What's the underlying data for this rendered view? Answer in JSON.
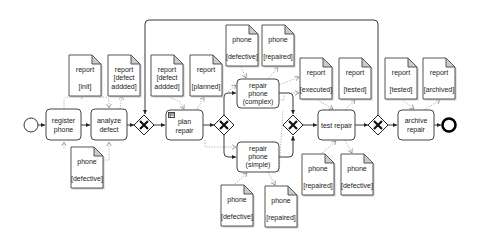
{
  "diagram": {
    "type": "BPMN process",
    "events": {
      "start": {
        "cx": 31,
        "cy": 125
      },
      "end": {
        "cx": 449,
        "cy": 125
      }
    },
    "tasks": [
      {
        "id": "register-phone",
        "lines": [
          "register",
          "phone"
        ],
        "x": 46,
        "y": 109,
        "w": 35,
        "h": 31
      },
      {
        "id": "analyze-defect",
        "lines": [
          "analyze",
          "defect"
        ],
        "x": 91,
        "y": 109,
        "w": 36,
        "h": 31
      },
      {
        "id": "plan-repair",
        "lines": [
          "plan",
          "repair"
        ],
        "x": 166,
        "y": 110,
        "w": 37,
        "h": 30,
        "icon": "business-rule-table-icon"
      },
      {
        "id": "repair-phone-complex",
        "lines": [
          "repair",
          "phone",
          "(complex)"
        ],
        "x": 237,
        "y": 79,
        "w": 42,
        "h": 29
      },
      {
        "id": "repair-phone-simple",
        "lines": [
          "repair",
          "phone",
          "(simple)"
        ],
        "x": 237,
        "y": 142,
        "w": 42,
        "h": 30
      },
      {
        "id": "test-repair",
        "lines": [
          "test repair"
        ],
        "x": 318,
        "y": 110,
        "w": 37,
        "h": 30
      },
      {
        "id": "archive-repair",
        "lines": [
          "archive",
          "repair"
        ],
        "x": 398,
        "y": 110,
        "w": 36,
        "h": 30
      }
    ],
    "gateways": [
      {
        "id": "gw-loop-merge",
        "cx": 144,
        "cy": 125
      },
      {
        "id": "gw-split",
        "cx": 224,
        "cy": 125
      },
      {
        "id": "gw-join",
        "cx": 293,
        "cy": 125
      },
      {
        "id": "gw-test-decision",
        "cx": 378,
        "cy": 125
      }
    ],
    "data_objects": [
      {
        "id": "report-init",
        "lines": [
          "report",
          "",
          "[init]"
        ],
        "x": 69,
        "y": 55
      },
      {
        "id": "report-defect-added-1",
        "lines": [
          "report",
          "[defect",
          "addded]"
        ],
        "x": 108,
        "y": 55
      },
      {
        "id": "phone-defective-1",
        "lines": [
          "phone",
          "",
          "[defective]"
        ],
        "x": 71,
        "y": 147
      },
      {
        "id": "report-defect-added-2",
        "lines": [
          "report",
          "[defect",
          "addded]"
        ],
        "x": 151,
        "y": 55
      },
      {
        "id": "report-planned",
        "lines": [
          "report",
          "",
          "[planned]"
        ],
        "x": 190,
        "y": 55
      },
      {
        "id": "phone-defective-2",
        "lines": [
          "phone",
          "",
          "[defective]"
        ],
        "x": 226,
        "y": 25
      },
      {
        "id": "phone-repaired-1",
        "lines": [
          "phone",
          "",
          "[repaired]"
        ],
        "x": 262,
        "y": 25
      },
      {
        "id": "report-executed",
        "lines": [
          "report",
          "",
          "[executed]"
        ],
        "x": 300,
        "y": 58
      },
      {
        "id": "report-tested-1",
        "lines": [
          "report",
          "",
          "[tested]"
        ],
        "x": 339,
        "y": 58
      },
      {
        "id": "report-tested-2",
        "lines": [
          "report",
          "",
          "[tested]"
        ],
        "x": 385,
        "y": 58
      },
      {
        "id": "report-archived",
        "lines": [
          "report",
          "",
          "[archived]"
        ],
        "x": 423,
        "y": 58
      },
      {
        "id": "phone-repaired-2",
        "lines": [
          "phone",
          "",
          "[repaired]"
        ],
        "x": 302,
        "y": 154
      },
      {
        "id": "phone-defective-3",
        "lines": [
          "phone",
          "",
          "[defective]"
        ],
        "x": 341,
        "y": 154
      },
      {
        "id": "phone-defective-4",
        "lines": [
          "phone",
          "",
          "[defective]"
        ],
        "x": 221,
        "y": 185
      },
      {
        "id": "phone-repaired-3",
        "lines": [
          "phone",
          "",
          "[repaired]"
        ],
        "x": 265,
        "y": 186
      }
    ],
    "colors": {
      "stroke": "#222222",
      "association": "#999999",
      "fill": "#ffffff"
    }
  }
}
